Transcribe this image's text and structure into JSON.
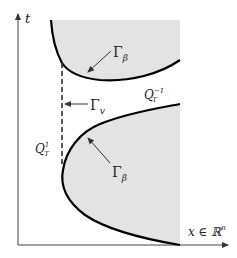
{
  "diagram": {
    "axes": {
      "t_label": "t",
      "x_label": "x ∈ ℝ",
      "x_label_sup": "n"
    },
    "labels": {
      "gamma_beta_top": {
        "main": "Γ",
        "sub": "β"
      },
      "gamma_v": {
        "main": "Γ",
        "sub": "v"
      },
      "q_minus": {
        "main": "Q",
        "sub": "T",
        "sup": "−1"
      },
      "q_plus": {
        "main": "Q",
        "sub": "T",
        "sup": "1"
      },
      "gamma_beta_bottom": {
        "main": "Γ",
        "sub": "β"
      }
    },
    "colors": {
      "shade": "#e3e3e3",
      "curve": "#000000",
      "axis": "#333333"
    }
  }
}
